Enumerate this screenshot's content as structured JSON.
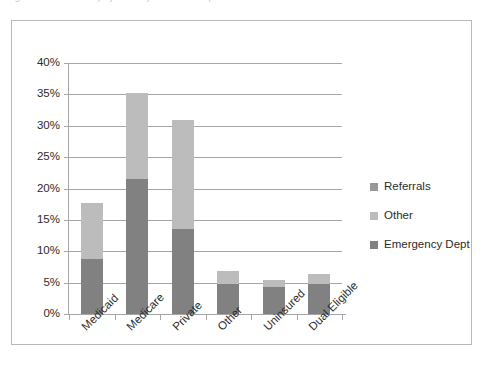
{
  "caption": {
    "text": "Figure 1. Source of payment by source of inpatient admission"
  },
  "chart_data": {
    "type": "bar",
    "subtype": "stacked-bar",
    "title": "",
    "xlabel": "",
    "ylabel": "",
    "categories": [
      "Medicaid",
      "Medicare",
      "Private",
      "Other",
      "Uninsured",
      "Dual Eligible"
    ],
    "series": [
      {
        "name": "Emergency Dept",
        "color": "#818181",
        "values": [
          8.8,
          21.5,
          13.5,
          4.8,
          4.3,
          4.8
        ]
      },
      {
        "name": "Other",
        "color": "#bcbcbc",
        "values": [
          8.9,
          13.8,
          17.4,
          2.0,
          1.1,
          1.6
        ]
      },
      {
        "name": "Referrals",
        "color": "#989898",
        "values": [
          0,
          0,
          0,
          0,
          0,
          0
        ]
      }
    ],
    "totals": [
      17.7,
      35.3,
      30.9,
      6.8,
      5.4,
      6.4
    ],
    "ylim": [
      0,
      40
    ],
    "yticks": [
      "0%",
      "5%",
      "10%",
      "15%",
      "20%",
      "25%",
      "30%",
      "35%",
      "40%"
    ],
    "ytick_values": [
      0,
      5,
      10,
      15,
      20,
      25,
      30,
      35,
      40
    ],
    "grid": true,
    "legend_position": "right",
    "legend": [
      {
        "label": "Referrals",
        "color": "#989898"
      },
      {
        "label": "Other",
        "color": "#bcbcbc"
      },
      {
        "label": "Emergency Dept",
        "color": "#818181"
      }
    ]
  }
}
